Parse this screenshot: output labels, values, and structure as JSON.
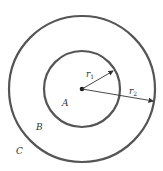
{
  "diagram": {
    "center_dot": {
      "cx": 82,
      "cy": 89
    },
    "inner_circle": {
      "r": 38,
      "stroke": "#555555"
    },
    "outer_circle": {
      "r": 73,
      "stroke": "#555555"
    },
    "regions": [
      {
        "label": "A",
        "x": 62,
        "y": 106
      },
      {
        "label": "B",
        "x": 36,
        "y": 130
      },
      {
        "label": "C",
        "x": 16,
        "y": 154
      }
    ],
    "radii": [
      {
        "name": "r",
        "sub": "1",
        "x": 86,
        "y": 77
      },
      {
        "name": "r",
        "sub": "2",
        "x": 129,
        "y": 94
      }
    ]
  }
}
